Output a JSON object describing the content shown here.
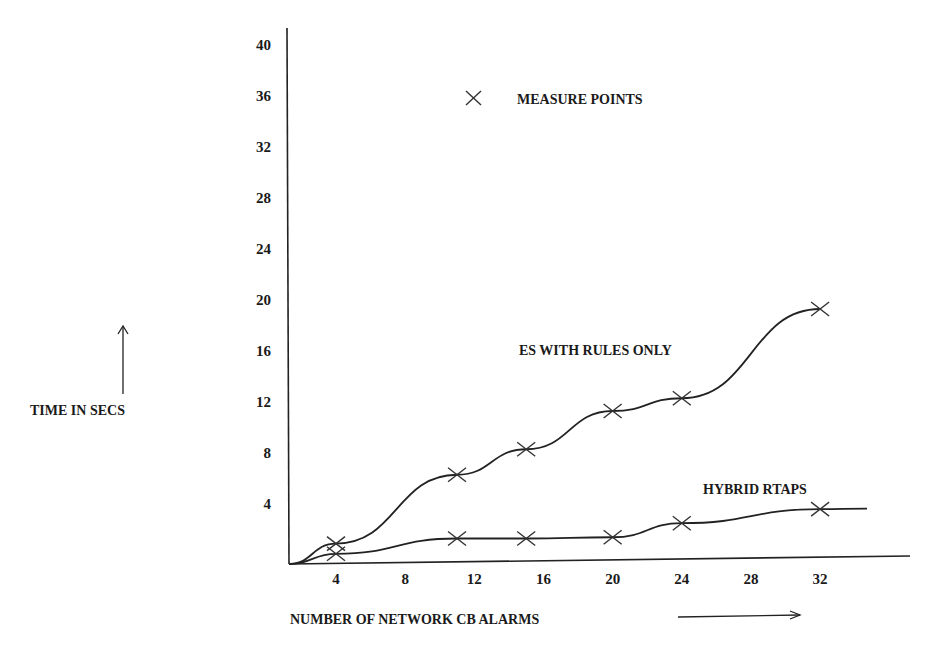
{
  "chart_data": {
    "type": "line",
    "title": "",
    "xlabel": "NUMBER OF NETWORK CB ALARMS",
    "ylabel": "TIME IN SECS",
    "x_ticks": [
      4,
      8,
      12,
      16,
      20,
      24,
      28,
      32
    ],
    "y_ticks": [
      4,
      8,
      12,
      16,
      20,
      24,
      28,
      32,
      36,
      40
    ],
    "xlim": [
      0,
      36
    ],
    "ylim": [
      0,
      40
    ],
    "grid": false,
    "legend": {
      "marker": "×",
      "label": "MEASURE POINTS",
      "position": "top-center"
    },
    "series": [
      {
        "name": "ES WITH RULES ONLY",
        "x": [
          0,
          4,
          11,
          15,
          20,
          24,
          32
        ],
        "y": [
          0,
          1.6,
          7,
          9,
          12,
          13,
          20
        ]
      },
      {
        "name": "HYBRID RTAPS",
        "x": [
          0,
          4,
          11,
          15,
          20,
          24,
          32
        ],
        "y": [
          0,
          0.8,
          2,
          2,
          2.1,
          3.2,
          4.3
        ]
      }
    ]
  },
  "labels": {
    "legend": "MEASURE POINTS",
    "series_es": "ES WITH RULES ONLY",
    "series_hybrid": "HYBRID RTAPS",
    "y_axis": "TIME IN SECS",
    "x_axis": "NUMBER OF NETWORK CB ALARMS"
  }
}
